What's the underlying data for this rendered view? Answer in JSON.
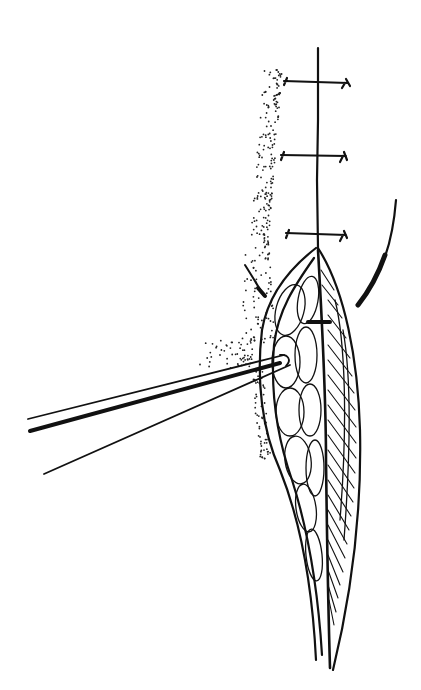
{
  "figure": {
    "type": "surgical-line-illustration",
    "background": "#ffffff",
    "ink_color": "#111111",
    "elements": [
      "incision-line",
      "interrupted-sutures",
      "wound-opening",
      "fat-lobules",
      "hatched-muscle-layer",
      "forceps",
      "curved-needle",
      "retraction-mark",
      "stippled-skin"
    ],
    "suture_count": 3,
    "text_labels": []
  }
}
